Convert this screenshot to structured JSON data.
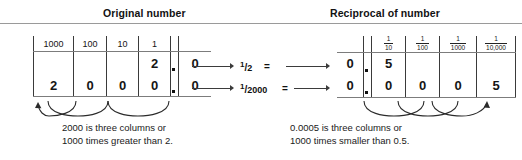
{
  "panels": {
    "left": {
      "title": "Original number",
      "columns": [
        "1000",
        "100",
        "10",
        "1"
      ],
      "rows": [
        {
          "digits": [
            "",
            "",
            "",
            "2"
          ],
          "decimal": ".",
          "fraction_digits": [
            "0"
          ]
        },
        {
          "digits": [
            "2",
            "0",
            "0",
            "0"
          ],
          "decimal": ".",
          "fraction_digits": [
            "0"
          ]
        }
      ],
      "caption_line1": "2000 is three columns or",
      "caption_line2": "1000 times greater than 2."
    },
    "right": {
      "title": "Reciprocal of number",
      "columns": [
        {
          "numerator": "1",
          "denominator": "10"
        },
        {
          "numerator": "1",
          "denominator": "100"
        },
        {
          "numerator": "1",
          "denominator": "1000"
        },
        {
          "numerator": "1",
          "denominator": "10,000"
        }
      ],
      "rows": [
        {
          "whole": "0",
          "decimal": ".",
          "digits": [
            "5",
            "",
            "",
            ""
          ]
        },
        {
          "whole": "0",
          "decimal": ".",
          "digits": [
            "0",
            "0",
            "0",
            "5"
          ]
        }
      ],
      "caption_line1": "0.0005 is three columns or",
      "caption_line2": "1000 times smaller than 0.5."
    }
  },
  "middle": {
    "row1": {
      "fraction_numerator": "1",
      "fraction_denominator": "2",
      "equals": "="
    },
    "row2": {
      "fraction_numerator": "1",
      "fraction_denominator": "2000",
      "equals": "="
    }
  },
  "colors": {
    "ink": "#111111",
    "rule": "#9a9a9a",
    "cell_border": "#3a3a3a",
    "background": "#ffffff"
  }
}
